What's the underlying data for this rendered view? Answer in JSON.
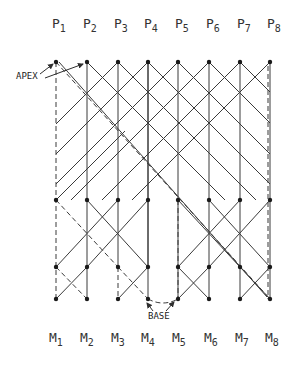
{
  "diagram": {
    "top_labels": [
      {
        "base": "P",
        "sub": "1"
      },
      {
        "base": "P",
        "sub": "2"
      },
      {
        "base": "P",
        "sub": "3"
      },
      {
        "base": "P",
        "sub": "4"
      },
      {
        "base": "P",
        "sub": "5"
      },
      {
        "base": "P",
        "sub": "6"
      },
      {
        "base": "P",
        "sub": "7"
      },
      {
        "base": "P",
        "sub": "8"
      }
    ],
    "bottom_labels": [
      {
        "base": "M",
        "sub": "1"
      },
      {
        "base": "M",
        "sub": "2"
      },
      {
        "base": "M",
        "sub": "3"
      },
      {
        "base": "M",
        "sub": "4"
      },
      {
        "base": "M",
        "sub": "5"
      },
      {
        "base": "M",
        "sub": "6"
      },
      {
        "base": "M",
        "sub": "7"
      },
      {
        "base": "M",
        "sub": "8"
      }
    ],
    "annotations": {
      "apex": "APEX",
      "base": "BASE"
    },
    "columns_x": [
      56,
      87,
      118,
      148,
      178,
      209,
      240,
      270
    ],
    "rows_y": {
      "top": 62,
      "mid": 200,
      "lower": 267,
      "bottom": 299
    },
    "line_color": "#2e2e2e"
  }
}
